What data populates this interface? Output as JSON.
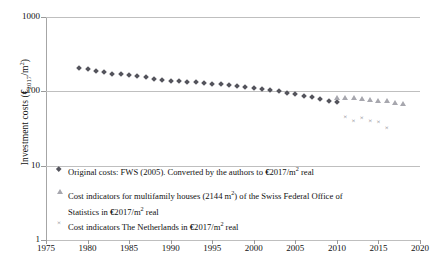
{
  "chart_data": {
    "type": "scatter",
    "title": "",
    "xlabel": "",
    "ylabel": "Investment costs  (€2017/m2)",
    "ylabel_parts": {
      "prefix": "Investment costs  (",
      "currency": "€",
      "sub": "2017",
      "mid": "/m",
      "sup": "2",
      "suffix": ")"
    },
    "xlim": [
      1975,
      2020
    ],
    "ylim": [
      1,
      1000
    ],
    "yscale": "log",
    "xticks": [
      "1975",
      "1980",
      "1985",
      "1990",
      "1995",
      "2000",
      "2005",
      "2010",
      "2015",
      "2020"
    ],
    "yticks": [
      "1000",
      "100",
      "10",
      "1"
    ],
    "grid": "horizontal",
    "legend_position": "inside-bottom-left",
    "series": [
      {
        "name": "Original costs: FWS (2005). Converted by the authors to €2017/m2 real",
        "marker": "diamond",
        "color": "#54545c",
        "points": [
          [
            1979,
            205
          ],
          [
            1980,
            199
          ],
          [
            1981,
            190
          ],
          [
            1982,
            181
          ],
          [
            1983,
            173
          ],
          [
            1984,
            171
          ],
          [
            1985,
            165
          ],
          [
            1986,
            160
          ],
          [
            1987,
            155
          ],
          [
            1988,
            148
          ],
          [
            1989,
            143
          ],
          [
            1990,
            138
          ],
          [
            1991,
            136
          ],
          [
            1992,
            134
          ],
          [
            1993,
            132
          ],
          [
            1994,
            130
          ],
          [
            1995,
            127
          ],
          [
            1996,
            124
          ],
          [
            1997,
            121
          ],
          [
            1998,
            118
          ],
          [
            1999,
            114
          ],
          [
            2000,
            111
          ],
          [
            2001,
            108
          ],
          [
            2002,
            104
          ],
          [
            2003,
            100
          ],
          [
            2004,
            96
          ],
          [
            2005,
            92
          ],
          [
            2006,
            87
          ],
          [
            2007,
            83
          ],
          [
            2008,
            79
          ],
          [
            2009,
            75
          ],
          [
            2010,
            72
          ]
        ]
      },
      {
        "name": "Cost indicators for multifamily houses (2144 m2) of the Swiss Federal Office of Statistics in €2017/m2 real",
        "marker": "triangle",
        "color": "#a7a7ae",
        "points": [
          [
            2010,
            82
          ],
          [
            2011,
            82
          ],
          [
            2012,
            81
          ],
          [
            2013,
            79
          ],
          [
            2014,
            77
          ],
          [
            2015,
            75
          ],
          [
            2016,
            73
          ],
          [
            2017,
            70
          ],
          [
            2018,
            68
          ]
        ]
      },
      {
        "name": "Cost indicators The Netherlands in €2017/m2 real",
        "marker": "cross",
        "color": "#6e6e76",
        "points": [
          [
            2011,
            45
          ],
          [
            2012,
            40
          ],
          [
            2013,
            44
          ],
          [
            2014,
            40
          ],
          [
            2015,
            39
          ],
          [
            2016,
            32
          ]
        ]
      }
    ]
  },
  "legend": {
    "items": [
      {
        "marker": "diamond-marker",
        "text_a": "Original costs: FWS (2005). Converted by the authors to ",
        "currency": "€",
        "text_b": "2017/m",
        "sup": "2",
        "text_c": " real"
      },
      {
        "marker": "triangle-marker",
        "text_a": "Cost indicators for multifamily houses (2144 m",
        "sup": "2",
        "text_b": ") of the Swiss Federal Office of",
        "line2_a": "Statistics in ",
        "currency": "€",
        "line2_b": "2017/m",
        "line2_sup": "2",
        "line2_c": " real"
      },
      {
        "marker": "cross-marker",
        "text_a": "Cost indicators The Netherlands in ",
        "currency": "€",
        "text_b": "2017/m",
        "sup": "2",
        "text_c": " real"
      }
    ]
  }
}
